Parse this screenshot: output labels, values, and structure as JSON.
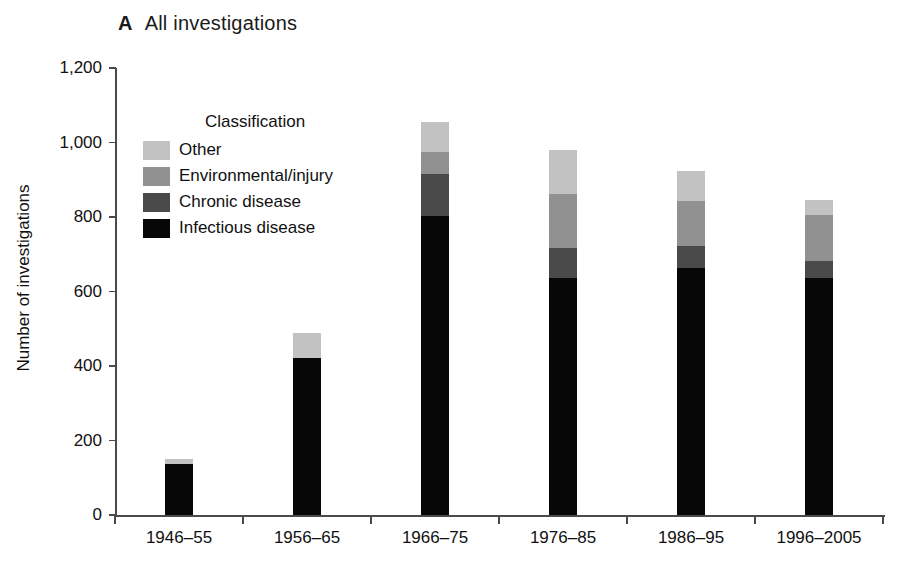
{
  "panel": {
    "letter": "A",
    "title": "All investigations"
  },
  "chart_data": {
    "type": "bar",
    "subtype": "stacked-vertical",
    "title": "All investigations",
    "panel_letter": "A",
    "xlabel": "",
    "ylabel": "Number of investigations",
    "ylim": [
      0,
      1200
    ],
    "yticks": [
      0,
      200,
      400,
      600,
      800,
      1000,
      1200
    ],
    "ytick_labels": [
      "0",
      "200",
      "400",
      "600",
      "800",
      "1,000",
      "1,200"
    ],
    "grid": false,
    "legend_title": "Classification",
    "legend_position": "inside-upper-left",
    "categories": [
      "1946–55",
      "1956–65",
      "1966–75",
      "1976–85",
      "1986–95",
      "1996–2005"
    ],
    "series": [
      {
        "name": "Infectious disease",
        "color": "#070707",
        "values": [
          136,
          421,
          803,
          635,
          664,
          637
        ]
      },
      {
        "name": "Chronic disease",
        "color": "#4a4a4a",
        "values": [
          0,
          0,
          112,
          82,
          59,
          46
        ]
      },
      {
        "name": "Environmental/injury",
        "color": "#919191",
        "values": [
          0,
          0,
          60,
          144,
          120,
          122
        ]
      },
      {
        "name": "Other",
        "color": "#c2c2c2",
        "values": [
          14,
          67,
          80,
          119,
          80,
          40
        ]
      }
    ],
    "totals": [
      150,
      488,
      1055,
      980,
      923,
      845
    ],
    "stack_order_bottom_to_top": [
      "Infectious disease",
      "Chronic disease",
      "Environmental/injury",
      "Other"
    ]
  },
  "legend": {
    "title": "Classification",
    "items": [
      {
        "label": "Other",
        "color": "#c2c2c2"
      },
      {
        "label": "Environmental/injury",
        "color": "#919191"
      },
      {
        "label": "Chronic disease",
        "color": "#4a4a4a"
      },
      {
        "label": "Infectious disease",
        "color": "#070707"
      }
    ]
  },
  "axes": {
    "y_title": "Number of investigations",
    "y_tick_labels": [
      "1,200",
      "1,000",
      "800",
      "600",
      "400",
      "200",
      "0"
    ],
    "x_tick_labels": [
      "1946–55",
      "1956–65",
      "1966–75",
      "1976–85",
      "1986–95",
      "1996–2005"
    ]
  }
}
